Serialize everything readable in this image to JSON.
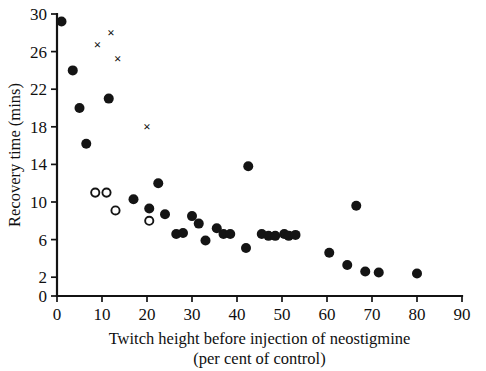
{
  "chart_data": {
    "type": "scatter",
    "title": "",
    "xlabel": "Twitch height before injection of neostigmine (per cent of control)",
    "xlabel_line1": "Twitch height before injection of neostigmine",
    "xlabel_line2": "(per cent of control)",
    "ylabel": "Recovery time (mins)",
    "xlim": [
      0,
      90
    ],
    "ylim": [
      0,
      30
    ],
    "xticks": [
      0,
      10,
      20,
      30,
      40,
      50,
      60,
      70,
      80,
      90
    ],
    "xtick_labels": [
      "0",
      "10",
      "20",
      "30",
      "40",
      "50",
      "60",
      "70",
      "80",
      "90"
    ],
    "yticks": [
      0,
      2,
      6,
      10,
      14,
      18,
      22,
      26,
      30
    ],
    "ytick_labels": [
      "0",
      "2",
      "6",
      "10",
      "14",
      "18",
      "22",
      "26",
      "30"
    ],
    "grid": false,
    "legend": false,
    "marker_color": "#141414",
    "axis_color": "#131313",
    "background": "#ffffff",
    "series": [
      {
        "name": "filled-circle",
        "marker": "filled-circle",
        "points": [
          [
            1.0,
            29.2
          ],
          [
            3.5,
            24.0
          ],
          [
            5.0,
            20.0
          ],
          [
            6.5,
            16.2
          ],
          [
            11.5,
            21.0
          ],
          [
            22.5,
            12.0
          ],
          [
            42.5,
            13.8
          ],
          [
            17.0,
            10.3
          ],
          [
            20.5,
            9.3
          ],
          [
            24.0,
            8.7
          ],
          [
            26.5,
            6.6
          ],
          [
            28.0,
            6.7
          ],
          [
            30.0,
            8.5
          ],
          [
            31.5,
            7.7
          ],
          [
            33.0,
            5.9
          ],
          [
            35.5,
            7.2
          ],
          [
            37.0,
            6.6
          ],
          [
            38.5,
            6.6
          ],
          [
            42.0,
            5.1
          ],
          [
            45.5,
            6.6
          ],
          [
            47.0,
            6.4
          ],
          [
            48.5,
            6.4
          ],
          [
            50.5,
            6.6
          ],
          [
            51.5,
            6.4
          ],
          [
            53.0,
            6.5
          ],
          [
            60.5,
            4.6
          ],
          [
            66.5,
            9.6
          ],
          [
            64.5,
            3.3
          ],
          [
            68.5,
            2.6
          ],
          [
            71.5,
            2.5
          ],
          [
            80.0,
            2.4
          ]
        ]
      },
      {
        "name": "open-circle",
        "marker": "open-circle",
        "points": [
          [
            8.5,
            11.0
          ],
          [
            11.0,
            11.0
          ],
          [
            13.0,
            9.1
          ],
          [
            20.5,
            8.0
          ]
        ]
      },
      {
        "name": "cross",
        "marker": "cross",
        "points": [
          [
            9.0,
            26.8
          ],
          [
            12.0,
            28.0
          ],
          [
            13.5,
            25.3
          ],
          [
            20.0,
            18.0
          ]
        ]
      }
    ]
  }
}
